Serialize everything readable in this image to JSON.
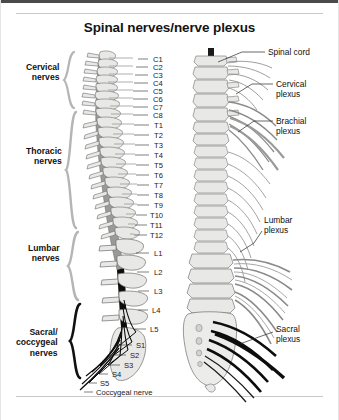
{
  "figure": {
    "title": "Spinal nerves/nerve plexus",
    "background_color": "#ffffff",
    "border_color": "#4a4a4a",
    "rule_color": "#c8c8c8"
  },
  "colors": {
    "bone_fill": "#e8e8e6",
    "bone_stroke": "#6f6f6f",
    "cord_gray": "#9a9a9a",
    "nerve_gray": "#8c8c8c",
    "nerve_dark": "#0d0d0d",
    "bracket_gray": "#b5b5b5",
    "bracket_dark": "#111111",
    "leader_line": "#2a2a2a",
    "text": "#141414"
  },
  "group_labels": [
    {
      "name": "cervical-nerves",
      "line1": "Cervical",
      "line2": "nerves",
      "x": 26,
      "y": 62,
      "bracket_top": 52,
      "bracket_bottom": 108,
      "bracket_color": "#b5b5b5"
    },
    {
      "name": "thoracic-nerves",
      "line1": "Thoracic",
      "line2": "nerves",
      "x": 26,
      "y": 146,
      "bracket_top": 112,
      "bracket_bottom": 228,
      "bracket_color": "#b5b5b5"
    },
    {
      "name": "lumbar-nerves",
      "line1": "Lumbar",
      "line2": "nerves",
      "x": 28,
      "y": 243,
      "bracket_top": 232,
      "bracket_bottom": 300,
      "bracket_color": "#b5b5b5"
    },
    {
      "name": "sacral-coccygeal-nerves",
      "line1": "Sacral/",
      "line2": "coccygeal",
      "line3": "nerves",
      "x": 16,
      "y": 327,
      "bracket_top": 304,
      "bracket_bottom": 378,
      "bracket_color": "#111111"
    }
  ],
  "vertebra_labels": [
    {
      "id": "C1",
      "text": "C1",
      "x": 153,
      "y": 55,
      "tick_x1": 148,
      "tick_y1": 59,
      "tick_x2": 138,
      "tick_y2": 59
    },
    {
      "id": "C2",
      "text": "C2",
      "x": 153,
      "y": 63,
      "tick_x1": 148,
      "tick_y1": 67,
      "tick_x2": 136,
      "tick_y2": 67
    },
    {
      "id": "C3",
      "text": "C3",
      "x": 153,
      "y": 71,
      "tick_x1": 148,
      "tick_y1": 75,
      "tick_x2": 135,
      "tick_y2": 75
    },
    {
      "id": "C4",
      "text": "C4",
      "x": 153,
      "y": 79,
      "tick_x1": 148,
      "tick_y1": 83,
      "tick_x2": 134,
      "tick_y2": 83
    },
    {
      "id": "C5",
      "text": "C5",
      "x": 153,
      "y": 87,
      "tick_x1": 148,
      "tick_y1": 91,
      "tick_x2": 133,
      "tick_y2": 91
    },
    {
      "id": "C6",
      "text": "C6",
      "x": 153,
      "y": 95,
      "tick_x1": 148,
      "tick_y1": 99,
      "tick_x2": 133,
      "tick_y2": 99
    },
    {
      "id": "C7",
      "text": "C7",
      "x": 153,
      "y": 103,
      "tick_x1": 148,
      "tick_y1": 107,
      "tick_x2": 133,
      "tick_y2": 107
    },
    {
      "id": "C8",
      "text": "C8",
      "x": 153,
      "y": 111,
      "tick_x1": 148,
      "tick_y1": 115,
      "tick_x2": 133,
      "tick_y2": 115
    },
    {
      "id": "T1",
      "text": "T1",
      "x": 154,
      "y": 121,
      "tick_x1": 149,
      "tick_y1": 125,
      "tick_x2": 134,
      "tick_y2": 125
    },
    {
      "id": "T2",
      "text": "T2",
      "x": 154,
      "y": 131,
      "tick_x1": 149,
      "tick_y1": 135,
      "tick_x2": 134,
      "tick_y2": 135
    },
    {
      "id": "T3",
      "text": "T3",
      "x": 154,
      "y": 141,
      "tick_x1": 149,
      "tick_y1": 145,
      "tick_x2": 135,
      "tick_y2": 145
    },
    {
      "id": "T4",
      "text": "T4",
      "x": 154,
      "y": 151,
      "tick_x1": 149,
      "tick_y1": 155,
      "tick_x2": 135,
      "tick_y2": 155
    },
    {
      "id": "T5",
      "text": "T5",
      "x": 154,
      "y": 161,
      "tick_x1": 149,
      "tick_y1": 165,
      "tick_x2": 136,
      "tick_y2": 165
    },
    {
      "id": "T6",
      "text": "T6",
      "x": 154,
      "y": 171,
      "tick_x1": 149,
      "tick_y1": 175,
      "tick_x2": 136,
      "tick_y2": 175
    },
    {
      "id": "T7",
      "text": "T7",
      "x": 154,
      "y": 181,
      "tick_x1": 149,
      "tick_y1": 185,
      "tick_x2": 137,
      "tick_y2": 185
    },
    {
      "id": "T8",
      "text": "T8",
      "x": 154,
      "y": 191,
      "tick_x1": 149,
      "tick_y1": 195,
      "tick_x2": 137,
      "tick_y2": 195
    },
    {
      "id": "T9",
      "text": "T9",
      "x": 154,
      "y": 201,
      "tick_x1": 149,
      "tick_y1": 205,
      "tick_x2": 137,
      "tick_y2": 205
    },
    {
      "id": "T10",
      "text": "T10",
      "x": 150,
      "y": 211,
      "tick_x1": 147,
      "tick_y1": 215,
      "tick_x2": 136,
      "tick_y2": 215
    },
    {
      "id": "T11",
      "text": "T11",
      "x": 150,
      "y": 221,
      "tick_x1": 147,
      "tick_y1": 225,
      "tick_x2": 135,
      "tick_y2": 225
    },
    {
      "id": "T12",
      "text": "T12",
      "x": 150,
      "y": 231,
      "tick_x1": 147,
      "tick_y1": 235,
      "tick_x2": 134,
      "tick_y2": 235
    },
    {
      "id": "L1",
      "text": "L1",
      "x": 154,
      "y": 249,
      "tick_x1": 149,
      "tick_y1": 253,
      "tick_x2": 136,
      "tick_y2": 253
    },
    {
      "id": "L2",
      "text": "L2",
      "x": 154,
      "y": 268,
      "tick_x1": 149,
      "tick_y1": 272,
      "tick_x2": 137,
      "tick_y2": 272
    },
    {
      "id": "L3",
      "text": "L3",
      "x": 154,
      "y": 287,
      "tick_x1": 149,
      "tick_y1": 291,
      "tick_x2": 138,
      "tick_y2": 291
    },
    {
      "id": "L4",
      "text": "L4",
      "x": 152,
      "y": 306,
      "tick_x1": 148,
      "tick_y1": 310,
      "tick_x2": 138,
      "tick_y2": 310
    },
    {
      "id": "L5",
      "text": "L5",
      "x": 150,
      "y": 325,
      "tick_x1": 146,
      "tick_y1": 329,
      "tick_x2": 135,
      "tick_y2": 329
    },
    {
      "id": "S1",
      "text": "S1",
      "x": 136,
      "y": 341,
      "tick_x1": 132,
      "tick_y1": 345,
      "tick_x2": 120,
      "tick_y2": 345
    },
    {
      "id": "S2",
      "text": "S2",
      "x": 130,
      "y": 351,
      "tick_x1": 126,
      "tick_y1": 355,
      "tick_x2": 114,
      "tick_y2": 355
    },
    {
      "id": "S3",
      "text": "S3",
      "x": 124,
      "y": 361,
      "tick_x1": 120,
      "tick_y1": 365,
      "tick_x2": 108,
      "tick_y2": 365
    },
    {
      "id": "S4",
      "text": "S4",
      "x": 112,
      "y": 370,
      "tick_x1": 108,
      "tick_y1": 374,
      "tick_x2": 99,
      "tick_y2": 374
    },
    {
      "id": "S5",
      "text": "S5",
      "x": 100,
      "y": 379,
      "tick_x1": 97,
      "tick_y1": 383,
      "tick_x2": 89,
      "tick_y2": 383
    }
  ],
  "coccygeal_label": {
    "text": "Coccygeal nerve",
    "x": 96,
    "y": 388,
    "tick_x1": 93,
    "tick_y1": 392,
    "tick_x2": 84,
    "tick_y2": 392
  },
  "right_labels": [
    {
      "id": "spinal-cord",
      "line1": "Spinal cord",
      "line2": "",
      "x": 268,
      "y": 47,
      "leader": [
        [
          265,
          52
        ],
        [
          242,
          52
        ],
        [
          218,
          62
        ]
      ]
    },
    {
      "id": "cervical-plexus",
      "line1": "Cervical",
      "line2": "plexus",
      "x": 276,
      "y": 79,
      "leader": [
        [
          273,
          84
        ],
        [
          252,
          84
        ],
        [
          236,
          94
        ]
      ]
    },
    {
      "id": "brachial-plexus",
      "line1": "Brachial",
      "line2": "plexus",
      "x": 276,
      "y": 116,
      "leader": [
        [
          273,
          121
        ],
        [
          254,
          121
        ],
        [
          238,
          132
        ]
      ]
    },
    {
      "id": "lumbar-plexus",
      "line1": "Lumbar",
      "line2": "plexus",
      "x": 264,
      "y": 215,
      "leader": [
        [
          262,
          231
        ],
        [
          254,
          243
        ],
        [
          240,
          252
        ]
      ]
    },
    {
      "id": "sacral-plexus",
      "line1": "Sacral",
      "line2": "plexus",
      "x": 276,
      "y": 324,
      "leader": [
        [
          273,
          332
        ],
        [
          256,
          338
        ],
        [
          240,
          344
        ]
      ]
    }
  ]
}
